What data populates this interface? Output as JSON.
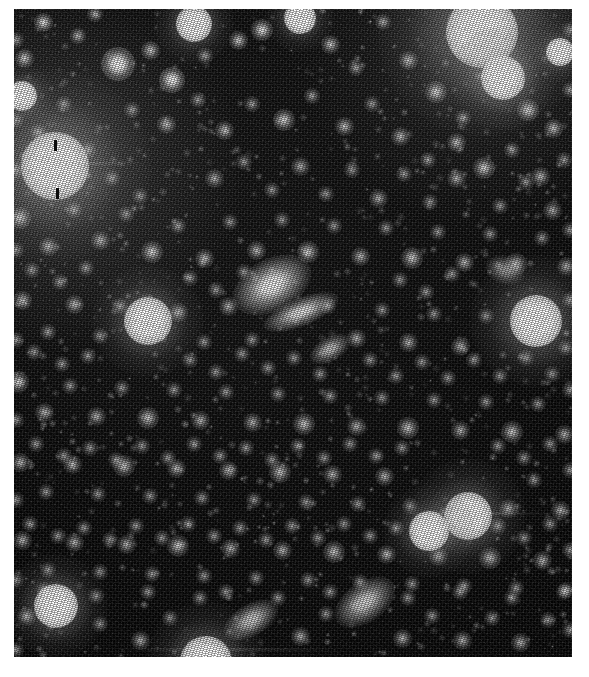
{
  "image": {
    "title": "Deep sky star field",
    "subject": "dense stellar field with faint galaxies",
    "modality": "monochrome astronomical plate",
    "canvas_width": 589,
    "canvas_height": 677,
    "border_color": "#ffffff",
    "background_color": "#000000",
    "plate": {
      "x": 14,
      "y": 9,
      "width": 558,
      "height": 648
    },
    "colors": {
      "sky": "#050505",
      "faint_source": "#9a9a9a",
      "mid_source": "#cfcfcf",
      "bright_source": "#ffffff",
      "halo": "#8a8a8a",
      "tick_mark": "#0a0a0a"
    }
  },
  "tick_marks": [
    {
      "name": "upper-tick",
      "x": 54,
      "y": 140,
      "width": 3,
      "height": 11
    },
    {
      "name": "lower-tick",
      "x": 56,
      "y": 188,
      "width": 3,
      "height": 11
    }
  ],
  "bright_sources": [
    {
      "id": "star-A",
      "label": "saturated star, upper left",
      "x": 55,
      "y": 166,
      "core": 34,
      "halo": 96,
      "intensity": 1.0
    },
    {
      "id": "star-B",
      "label": "saturated star, upper right",
      "x": 482,
      "y": 32,
      "core": 36,
      "halo": 104,
      "intensity": 1.0
    },
    {
      "id": "star-C",
      "label": "bright star below star-B",
      "x": 503,
      "y": 78,
      "core": 22,
      "halo": 52,
      "intensity": 0.95
    },
    {
      "id": "star-D",
      "label": "bright round star, right mid-field",
      "x": 536,
      "y": 321,
      "core": 26,
      "halo": 66,
      "intensity": 0.98
    },
    {
      "id": "star-E",
      "label": "bright star, lower right",
      "x": 468,
      "y": 516,
      "core": 24,
      "halo": 58,
      "intensity": 0.95
    },
    {
      "id": "star-F",
      "label": "bright star, lower right edge-on",
      "x": 429,
      "y": 531,
      "core": 20,
      "halo": 46,
      "intensity": 0.92
    },
    {
      "id": "star-G",
      "label": "bright star, lower left",
      "x": 56,
      "y": 606,
      "core": 22,
      "halo": 52,
      "intensity": 0.93
    },
    {
      "id": "star-H",
      "label": "bright fuzzy object, left of centre",
      "x": 148,
      "y": 321,
      "core": 24,
      "halo": 56,
      "intensity": 0.93
    },
    {
      "id": "star-I",
      "label": "bright star, bottom edge",
      "x": 206,
      "y": 662,
      "core": 26,
      "halo": 60,
      "intensity": 0.95
    },
    {
      "id": "star-J",
      "label": "bright star, top centre-left",
      "x": 194,
      "y": 24,
      "core": 18,
      "halo": 40,
      "intensity": 0.88
    },
    {
      "id": "star-K",
      "label": "bright star, top right of centre",
      "x": 300,
      "y": 18,
      "core": 16,
      "halo": 34,
      "intensity": 0.85
    },
    {
      "id": "star-L",
      "label": "bright star, upper left corner",
      "x": 22,
      "y": 96,
      "core": 15,
      "halo": 32,
      "intensity": 0.82
    },
    {
      "id": "star-M",
      "label": "bright star, right of star-B",
      "x": 560,
      "y": 52,
      "core": 14,
      "halo": 30,
      "intensity": 0.8
    }
  ],
  "extended_sources": [
    {
      "id": "galaxy-1",
      "label": "elongated galaxy, field centre",
      "x": 272,
      "y": 285,
      "w": 42,
      "h": 26,
      "angle": -28,
      "intensity": 1.0
    },
    {
      "id": "galaxy-2",
      "label": "edge-on streak below galaxy-1",
      "x": 301,
      "y": 312,
      "w": 40,
      "h": 14,
      "angle": -22,
      "intensity": 0.9
    },
    {
      "id": "galaxy-3",
      "label": "small elongated galaxy, mid field",
      "x": 330,
      "y": 349,
      "w": 22,
      "h": 12,
      "angle": -30,
      "intensity": 0.75
    },
    {
      "id": "galaxy-4",
      "label": "elongated galaxy, lower centre",
      "x": 251,
      "y": 620,
      "w": 30,
      "h": 16,
      "angle": -30,
      "intensity": 0.82
    },
    {
      "id": "galaxy-5",
      "label": "elongated galaxy, lower right of centre",
      "x": 365,
      "y": 602,
      "w": 34,
      "h": 20,
      "angle": -35,
      "intensity": 0.85
    },
    {
      "id": "galaxy-6",
      "label": "diffuse galaxy, right field",
      "x": 505,
      "y": 270,
      "w": 20,
      "h": 14,
      "angle": 20,
      "intensity": 0.6
    }
  ],
  "field_sources": [
    [
      43,
      22,
      5,
      0.7
    ],
    [
      78,
      36,
      4,
      0.55
    ],
    [
      118,
      64,
      9,
      0.92
    ],
    [
      150,
      50,
      5,
      0.6
    ],
    [
      172,
      80,
      7,
      0.85
    ],
    [
      205,
      56,
      4,
      0.5
    ],
    [
      238,
      40,
      5,
      0.62
    ],
    [
      262,
      30,
      6,
      0.72
    ],
    [
      330,
      44,
      5,
      0.58
    ],
    [
      356,
      68,
      4,
      0.48
    ],
    [
      383,
      22,
      4,
      0.52
    ],
    [
      408,
      60,
      5,
      0.6
    ],
    [
      436,
      92,
      6,
      0.7
    ],
    [
      463,
      118,
      4,
      0.5
    ],
    [
      528,
      110,
      6,
      0.74
    ],
    [
      553,
      128,
      5,
      0.58
    ],
    [
      24,
      58,
      5,
      0.62
    ],
    [
      95,
      14,
      4,
      0.5
    ],
    [
      132,
      110,
      4,
      0.46
    ],
    [
      166,
      124,
      5,
      0.56
    ],
    [
      198,
      100,
      4,
      0.44
    ],
    [
      224,
      130,
      5,
      0.55
    ],
    [
      252,
      104,
      4,
      0.46
    ],
    [
      284,
      120,
      6,
      0.66
    ],
    [
      312,
      96,
      4,
      0.48
    ],
    [
      344,
      126,
      5,
      0.56
    ],
    [
      372,
      104,
      4,
      0.44
    ],
    [
      400,
      136,
      5,
      0.54
    ],
    [
      428,
      160,
      4,
      0.46
    ],
    [
      456,
      142,
      5,
      0.56
    ],
    [
      484,
      168,
      6,
      0.64
    ],
    [
      512,
      150,
      4,
      0.46
    ],
    [
      540,
      176,
      5,
      0.54
    ],
    [
      564,
      160,
      4,
      0.44
    ],
    [
      20,
      218,
      6,
      0.66
    ],
    [
      48,
      246,
      5,
      0.56
    ],
    [
      74,
      210,
      4,
      0.46
    ],
    [
      100,
      240,
      5,
      0.55
    ],
    [
      126,
      214,
      4,
      0.44
    ],
    [
      152,
      252,
      6,
      0.64
    ],
    [
      178,
      226,
      4,
      0.46
    ],
    [
      204,
      258,
      5,
      0.56
    ],
    [
      230,
      222,
      4,
      0.44
    ],
    [
      256,
      250,
      5,
      0.54
    ],
    [
      282,
      220,
      4,
      0.44
    ],
    [
      308,
      252,
      6,
      0.62
    ],
    [
      334,
      226,
      4,
      0.44
    ],
    [
      360,
      256,
      5,
      0.54
    ],
    [
      386,
      228,
      4,
      0.44
    ],
    [
      412,
      258,
      6,
      0.62
    ],
    [
      438,
      232,
      4,
      0.44
    ],
    [
      464,
      262,
      5,
      0.54
    ],
    [
      490,
      234,
      4,
      0.44
    ],
    [
      516,
      264,
      6,
      0.6
    ],
    [
      542,
      238,
      4,
      0.44
    ],
    [
      566,
      266,
      5,
      0.52
    ],
    [
      22,
      300,
      5,
      0.56
    ],
    [
      48,
      332,
      4,
      0.46
    ],
    [
      74,
      304,
      5,
      0.54
    ],
    [
      100,
      336,
      4,
      0.44
    ],
    [
      120,
      306,
      4,
      0.44
    ],
    [
      178,
      312,
      5,
      0.54
    ],
    [
      204,
      342,
      4,
      0.44
    ],
    [
      228,
      306,
      5,
      0.52
    ],
    [
      252,
      340,
      4,
      0.44
    ],
    [
      328,
      306,
      4,
      0.44
    ],
    [
      356,
      338,
      5,
      0.52
    ],
    [
      382,
      310,
      4,
      0.44
    ],
    [
      408,
      342,
      5,
      0.52
    ],
    [
      434,
      314,
      4,
      0.44
    ],
    [
      460,
      346,
      5,
      0.52
    ],
    [
      486,
      316,
      4,
      0.44
    ],
    [
      566,
      348,
      4,
      0.44
    ],
    [
      18,
      382,
      6,
      0.62
    ],
    [
      44,
      412,
      5,
      0.54
    ],
    [
      70,
      386,
      4,
      0.44
    ],
    [
      96,
      416,
      5,
      0.52
    ],
    [
      122,
      388,
      4,
      0.44
    ],
    [
      148,
      418,
      6,
      0.6
    ],
    [
      174,
      390,
      4,
      0.44
    ],
    [
      200,
      420,
      5,
      0.52
    ],
    [
      226,
      392,
      4,
      0.44
    ],
    [
      252,
      422,
      5,
      0.52
    ],
    [
      278,
      394,
      4,
      0.44
    ],
    [
      304,
      424,
      6,
      0.6
    ],
    [
      330,
      396,
      4,
      0.44
    ],
    [
      356,
      426,
      5,
      0.52
    ],
    [
      382,
      398,
      4,
      0.44
    ],
    [
      408,
      428,
      6,
      0.6
    ],
    [
      434,
      400,
      4,
      0.44
    ],
    [
      460,
      430,
      5,
      0.52
    ],
    [
      486,
      402,
      4,
      0.44
    ],
    [
      512,
      432,
      6,
      0.6
    ],
    [
      538,
      404,
      4,
      0.44
    ],
    [
      564,
      434,
      5,
      0.52
    ],
    [
      20,
      462,
      5,
      0.54
    ],
    [
      46,
      492,
      4,
      0.44
    ],
    [
      72,
      464,
      5,
      0.52
    ],
    [
      98,
      494,
      4,
      0.44
    ],
    [
      124,
      466,
      6,
      0.58
    ],
    [
      150,
      496,
      4,
      0.44
    ],
    [
      176,
      468,
      5,
      0.52
    ],
    [
      202,
      498,
      4,
      0.44
    ],
    [
      228,
      470,
      5,
      0.52
    ],
    [
      254,
      500,
      4,
      0.44
    ],
    [
      280,
      472,
      6,
      0.58
    ],
    [
      306,
      502,
      4,
      0.44
    ],
    [
      332,
      474,
      5,
      0.52
    ],
    [
      358,
      504,
      4,
      0.44
    ],
    [
      384,
      476,
      5,
      0.52
    ],
    [
      410,
      506,
      4,
      0.44
    ],
    [
      508,
      508,
      5,
      0.52
    ],
    [
      534,
      480,
      4,
      0.44
    ],
    [
      560,
      510,
      5,
      0.52
    ],
    [
      22,
      540,
      5,
      0.52
    ],
    [
      48,
      570,
      4,
      0.44
    ],
    [
      74,
      542,
      5,
      0.52
    ],
    [
      100,
      572,
      4,
      0.44
    ],
    [
      126,
      544,
      5,
      0.52
    ],
    [
      152,
      574,
      4,
      0.44
    ],
    [
      178,
      546,
      6,
      0.58
    ],
    [
      204,
      576,
      4,
      0.44
    ],
    [
      230,
      548,
      5,
      0.52
    ],
    [
      256,
      578,
      4,
      0.44
    ],
    [
      282,
      550,
      5,
      0.52
    ],
    [
      308,
      580,
      4,
      0.44
    ],
    [
      334,
      552,
      6,
      0.58
    ],
    [
      360,
      582,
      4,
      0.44
    ],
    [
      386,
      554,
      5,
      0.52
    ],
    [
      412,
      584,
      4,
      0.44
    ],
    [
      438,
      556,
      5,
      0.52
    ],
    [
      464,
      586,
      4,
      0.44
    ],
    [
      490,
      558,
      6,
      0.58
    ],
    [
      516,
      588,
      4,
      0.44
    ],
    [
      542,
      560,
      5,
      0.52
    ],
    [
      566,
      590,
      4,
      0.44
    ],
    [
      26,
      616,
      5,
      0.52
    ],
    [
      100,
      624,
      4,
      0.44
    ],
    [
      140,
      640,
      5,
      0.52
    ],
    [
      170,
      618,
      4,
      0.44
    ],
    [
      300,
      636,
      5,
      0.52
    ],
    [
      326,
      614,
      4,
      0.44
    ],
    [
      402,
      638,
      5,
      0.52
    ],
    [
      432,
      616,
      4,
      0.44
    ],
    [
      462,
      640,
      5,
      0.52
    ],
    [
      492,
      618,
      4,
      0.44
    ],
    [
      520,
      642,
      5,
      0.52
    ],
    [
      548,
      620,
      4,
      0.44
    ],
    [
      38,
      132,
      4,
      0.44
    ],
    [
      64,
      104,
      4,
      0.44
    ],
    [
      88,
      150,
      4,
      0.44
    ],
    [
      112,
      178,
      4,
      0.44
    ],
    [
      140,
      196,
      4,
      0.44
    ],
    [
      214,
      178,
      5,
      0.5
    ],
    [
      244,
      162,
      4,
      0.44
    ],
    [
      272,
      190,
      4,
      0.44
    ],
    [
      300,
      166,
      5,
      0.5
    ],
    [
      326,
      194,
      4,
      0.44
    ],
    [
      352,
      170,
      4,
      0.44
    ],
    [
      378,
      198,
      5,
      0.5
    ],
    [
      404,
      174,
      4,
      0.44
    ],
    [
      430,
      202,
      4,
      0.44
    ],
    [
      456,
      178,
      5,
      0.5
    ],
    [
      500,
      206,
      4,
      0.44
    ],
    [
      526,
      182,
      4,
      0.44
    ],
    [
      552,
      210,
      5,
      0.5
    ],
    [
      32,
      270,
      4,
      0.44
    ],
    [
      60,
      282,
      4,
      0.44
    ],
    [
      86,
      268,
      4,
      0.44
    ],
    [
      190,
      278,
      4,
      0.44
    ],
    [
      216,
      290,
      4,
      0.44
    ],
    [
      244,
      272,
      4,
      0.44
    ],
    [
      400,
      280,
      4,
      0.44
    ],
    [
      426,
      292,
      4,
      0.44
    ],
    [
      452,
      274,
      4,
      0.44
    ],
    [
      34,
      352,
      4,
      0.44
    ],
    [
      62,
      364,
      4,
      0.44
    ],
    [
      88,
      356,
      4,
      0.44
    ],
    [
      190,
      360,
      4,
      0.44
    ],
    [
      216,
      372,
      4,
      0.44
    ],
    [
      242,
      354,
      4,
      0.44
    ],
    [
      268,
      368,
      4,
      0.44
    ],
    [
      294,
      358,
      4,
      0.44
    ],
    [
      320,
      374,
      4,
      0.44
    ],
    [
      370,
      360,
      4,
      0.44
    ],
    [
      396,
      376,
      4,
      0.44
    ],
    [
      422,
      362,
      4,
      0.44
    ],
    [
      448,
      378,
      4,
      0.44
    ],
    [
      474,
      360,
      4,
      0.44
    ],
    [
      500,
      376,
      4,
      0.44
    ],
    [
      526,
      358,
      4,
      0.44
    ],
    [
      552,
      374,
      4,
      0.44
    ],
    [
      36,
      444,
      4,
      0.44
    ],
    [
      64,
      456,
      4,
      0.44
    ],
    [
      90,
      448,
      4,
      0.44
    ],
    [
      116,
      460,
      4,
      0.44
    ],
    [
      142,
      446,
      4,
      0.44
    ],
    [
      168,
      458,
      4,
      0.44
    ],
    [
      194,
      444,
      4,
      0.44
    ],
    [
      220,
      456,
      4,
      0.44
    ],
    [
      246,
      448,
      4,
      0.44
    ],
    [
      272,
      460,
      4,
      0.44
    ],
    [
      298,
      446,
      4,
      0.44
    ],
    [
      324,
      458,
      4,
      0.44
    ],
    [
      350,
      444,
      4,
      0.44
    ],
    [
      376,
      456,
      4,
      0.44
    ],
    [
      402,
      448,
      4,
      0.44
    ],
    [
      498,
      446,
      4,
      0.44
    ],
    [
      524,
      458,
      4,
      0.44
    ],
    [
      550,
      444,
      4,
      0.44
    ],
    [
      30,
      524,
      4,
      0.44
    ],
    [
      58,
      536,
      4,
      0.44
    ],
    [
      84,
      528,
      4,
      0.44
    ],
    [
      110,
      540,
      4,
      0.44
    ],
    [
      136,
      526,
      4,
      0.44
    ],
    [
      162,
      538,
      4,
      0.44
    ],
    [
      188,
      524,
      4,
      0.44
    ],
    [
      214,
      536,
      4,
      0.44
    ],
    [
      240,
      528,
      4,
      0.44
    ],
    [
      266,
      540,
      4,
      0.44
    ],
    [
      292,
      526,
      4,
      0.44
    ],
    [
      318,
      538,
      4,
      0.44
    ],
    [
      344,
      524,
      4,
      0.44
    ],
    [
      370,
      536,
      4,
      0.44
    ],
    [
      396,
      528,
      4,
      0.44
    ],
    [
      498,
      526,
      4,
      0.44
    ],
    [
      524,
      538,
      4,
      0.44
    ],
    [
      550,
      524,
      4,
      0.44
    ],
    [
      44,
      590,
      4,
      0.44
    ],
    [
      96,
      596,
      4,
      0.44
    ],
    [
      148,
      592,
      4,
      0.44
    ],
    [
      200,
      598,
      4,
      0.44
    ],
    [
      226,
      592,
      4,
      0.44
    ],
    [
      278,
      598,
      4,
      0.44
    ],
    [
      330,
      592,
      4,
      0.44
    ],
    [
      408,
      598,
      4,
      0.44
    ],
    [
      460,
      592,
      4,
      0.44
    ],
    [
      512,
      598,
      4,
      0.44
    ],
    [
      564,
      592,
      4,
      0.44
    ],
    [
      16,
      40,
      4,
      0.44
    ],
    [
      16,
      120,
      4,
      0.44
    ],
    [
      16,
      170,
      4,
      0.44
    ],
    [
      16,
      250,
      4,
      0.44
    ],
    [
      16,
      340,
      4,
      0.44
    ],
    [
      16,
      420,
      4,
      0.44
    ],
    [
      16,
      500,
      4,
      0.44
    ],
    [
      16,
      580,
      4,
      0.44
    ],
    [
      16,
      650,
      4,
      0.44
    ],
    [
      570,
      30,
      4,
      0.44
    ],
    [
      570,
      90,
      4,
      0.44
    ],
    [
      570,
      230,
      4,
      0.44
    ],
    [
      570,
      300,
      4,
      0.44
    ],
    [
      570,
      390,
      4,
      0.44
    ],
    [
      570,
      470,
      4,
      0.44
    ],
    [
      570,
      550,
      4,
      0.44
    ],
    [
      570,
      630,
      4,
      0.44
    ]
  ],
  "faint_grain_sources": {
    "count": 900,
    "seed": 20240517,
    "min_radius": 1.5,
    "max_radius": 4.0,
    "min_intensity": 0.12,
    "max_intensity": 0.42
  },
  "streaks": [
    {
      "name": "streak-near-star-E",
      "x": 400,
      "y": 512,
      "width": 150,
      "height": 3,
      "intensity": 0.22
    },
    {
      "name": "streak-near-star-A",
      "x": 16,
      "y": 162,
      "width": 130,
      "height": 3,
      "intensity": 0.18
    },
    {
      "name": "streak-bottom",
      "x": 120,
      "y": 648,
      "width": 220,
      "height": 3,
      "intensity": 0.16
    }
  ]
}
